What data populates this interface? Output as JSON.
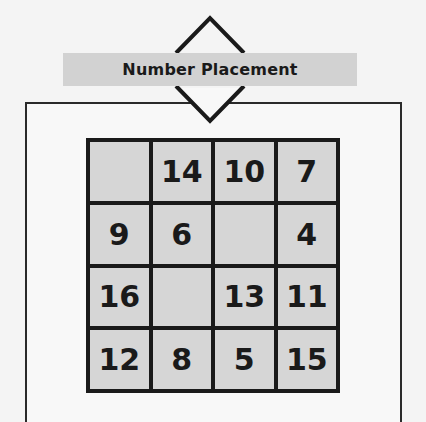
{
  "header": {
    "title": "Number Placement"
  },
  "puzzle": {
    "rows": 4,
    "cols": 4,
    "cells": [
      [
        "",
        "14",
        "10",
        "7"
      ],
      [
        "9",
        "6",
        "",
        "4"
      ],
      [
        "16",
        "",
        "13",
        "11"
      ],
      [
        "12",
        "8",
        "5",
        "15"
      ]
    ]
  },
  "colors": {
    "background": "#f4f4f4",
    "banner": "#d2d2d2",
    "cell_fill": "#d6d6d6",
    "grid_line": "#1a1a1a"
  }
}
